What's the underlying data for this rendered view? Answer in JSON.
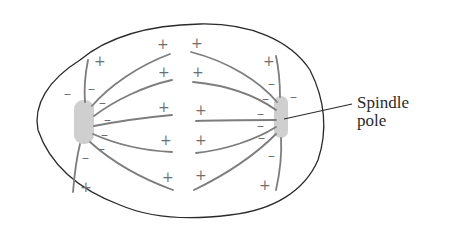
{
  "diagram": {
    "labels": {
      "spindle_pole_line1": "Spindle",
      "spindle_pole_line2": "pole"
    },
    "signs": {
      "plus": "+",
      "minus": "–"
    },
    "colors": {
      "outline": "#2a2a2a",
      "fiber": "#7d7d7d",
      "pole": "#cfcfcf",
      "sign": "#6e6e6e"
    }
  }
}
